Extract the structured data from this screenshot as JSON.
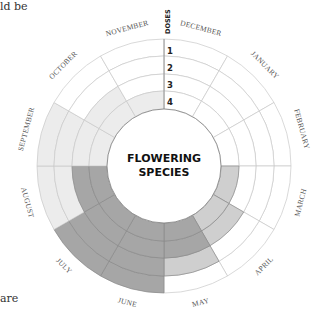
{
  "fragments": {
    "top_left": "ld be",
    "bottom_left": "are"
  },
  "diagram": {
    "center_title_line1": "FLOWERING",
    "center_title_line2": "SPECIES",
    "doses_label": "DOSES",
    "dose_rings": [
      "1",
      "2",
      "3",
      "4"
    ],
    "colors": {
      "empty": "#ffffff",
      "light": "#ececec",
      "medium": "#cfcfcf",
      "dark": "#a6a6a6",
      "grid": "#c8c8c8",
      "inner_circle": "#888888"
    },
    "months": [
      {
        "label": "DECEMBER",
        "rings": [
          "empty",
          "empty",
          "empty",
          "empty"
        ]
      },
      {
        "label": "JANUARY",
        "rings": [
          "empty",
          "empty",
          "empty",
          "empty"
        ]
      },
      {
        "label": "FEBRUARY",
        "rings": [
          "empty",
          "empty",
          "empty",
          "empty"
        ]
      },
      {
        "label": "MARCH",
        "rings": [
          "empty",
          "empty",
          "empty",
          "medium"
        ]
      },
      {
        "label": "APRIL",
        "rings": [
          "empty",
          "empty",
          "medium",
          "medium"
        ]
      },
      {
        "label": "MAY",
        "rings": [
          "empty",
          "medium",
          "dark",
          "dark"
        ]
      },
      {
        "label": "JUNE",
        "rings": [
          "dark",
          "dark",
          "dark",
          "dark"
        ]
      },
      {
        "label": "JULY",
        "rings": [
          "dark",
          "dark",
          "dark",
          "dark"
        ]
      },
      {
        "label": "AUGUST",
        "rings": [
          "light",
          "light",
          "dark",
          "dark"
        ]
      },
      {
        "label": "SEPTEMBER",
        "rings": [
          "light",
          "light",
          "light",
          "light"
        ]
      },
      {
        "label": "OCTOBER",
        "rings": [
          "empty",
          "empty",
          "light",
          "light"
        ]
      },
      {
        "label": "NOVEMBER",
        "rings": [
          "empty",
          "empty",
          "empty",
          "light"
        ]
      }
    ]
  }
}
